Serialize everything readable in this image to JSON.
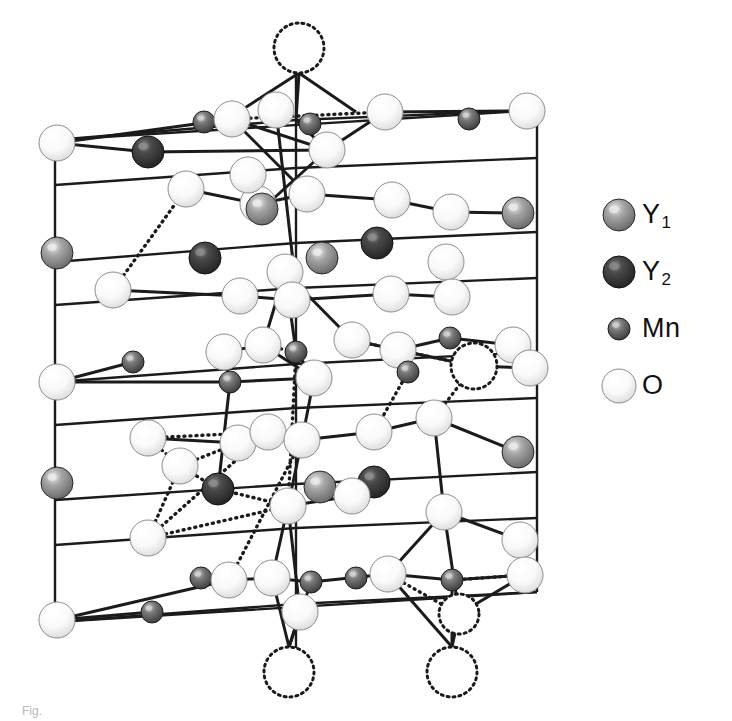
{
  "figure": {
    "kind": "crystal-structure-diagram",
    "compound": "YMnO3",
    "background_color": "#ffffff",
    "caption_fragment": "Fig."
  },
  "legend": {
    "position": "right",
    "items": [
      {
        "id": "Y1",
        "label": "Y",
        "subscript": "1",
        "icon": "sphere-icon",
        "radius": 16,
        "fill": "#7b7b7b",
        "highlight": "#e8e8e8",
        "edge": "#2a2a2a"
      },
      {
        "id": "Y2",
        "label": "Y",
        "subscript": "2",
        "icon": "sphere-icon",
        "radius": 16,
        "fill": "#333333",
        "highlight": "#8a8a8a",
        "edge": "#111111"
      },
      {
        "id": "Mn",
        "label": "Mn",
        "subscript": "",
        "icon": "sphere-icon",
        "radius": 11,
        "fill": "#565656",
        "highlight": "#d2d2d2",
        "edge": "#1d1d1d"
      },
      {
        "id": "O",
        "label": "O",
        "subscript": "",
        "icon": "sphere-icon",
        "radius": 17,
        "fill": "#f4f4f4",
        "highlight": "#ffffff",
        "edge": "#8d8d8d"
      }
    ]
  },
  "structure": {
    "viewbox": "0 0 600 700",
    "bond_color": "#1b1b1b",
    "bond_width": 3.0,
    "cell_edge_width": 2.4,
    "dotted_bond_width": 3.4,
    "dotted_dash": "1 5",
    "ghost_circle": {
      "stroke": "#1b1b1b",
      "dash": "2 4",
      "width": 3,
      "fill": "#ffffff"
    },
    "species": {
      "Y1": {
        "r": 16,
        "fill": "#7b7b7b",
        "highlight": "#ececec",
        "edge": "#2a2a2a"
      },
      "Y2": {
        "r": 16,
        "fill": "#333333",
        "highlight": "#8f8f8f",
        "edge": "#111111"
      },
      "Mn": {
        "r": 11,
        "fill": "#565656",
        "highlight": "#d6d6d6",
        "edge": "#1d1d1d"
      },
      "O": {
        "r": 18,
        "fill": "#f5f5f5",
        "highlight": "#ffffff",
        "edge": "#8d8d8d"
      }
    },
    "cell_edges": [
      [
        55,
        140,
        55,
        622
      ],
      [
        537,
        110,
        537,
        592
      ],
      [
        296,
        48,
        296,
        686
      ],
      [
        55,
        140,
        537,
        110
      ],
      [
        55,
        622,
        537,
        592
      ]
    ],
    "frame_rails": [
      [
        55,
        140,
        296,
        120
      ],
      [
        296,
        120,
        537,
        110
      ],
      [
        55,
        185,
        296,
        168
      ],
      [
        296,
        168,
        537,
        158
      ],
      [
        55,
        262,
        296,
        243
      ],
      [
        296,
        243,
        537,
        232
      ],
      [
        55,
        305,
        296,
        288
      ],
      [
        296,
        288,
        537,
        278
      ],
      [
        55,
        382,
        296,
        364
      ],
      [
        296,
        364,
        537,
        352
      ],
      [
        55,
        425,
        296,
        408
      ],
      [
        296,
        408,
        537,
        398
      ],
      [
        55,
        500,
        296,
        484
      ],
      [
        296,
        484,
        537,
        472
      ],
      [
        55,
        545,
        296,
        528
      ],
      [
        296,
        528,
        537,
        518
      ],
      [
        55,
        622,
        296,
        604
      ],
      [
        296,
        604,
        537,
        592
      ]
    ],
    "ghost_atoms": [
      {
        "cx": 299,
        "cy": 48,
        "r": 25,
        "species": "O"
      },
      {
        "cx": 474,
        "cy": 366,
        "r": 23,
        "species": "O"
      },
      {
        "cx": 289,
        "cy": 672,
        "r": 25,
        "species": "O"
      },
      {
        "cx": 452,
        "cy": 672,
        "r": 25,
        "species": "O"
      },
      {
        "cx": 459,
        "cy": 614,
        "r": 20,
        "species": "O"
      }
    ],
    "atoms": [
      {
        "cx": 57,
        "cy": 143,
        "species": "O"
      },
      {
        "cx": 148,
        "cy": 152,
        "species": "Y2"
      },
      {
        "cx": 204,
        "cy": 122,
        "species": "Mn"
      },
      {
        "cx": 232,
        "cy": 119,
        "species": "O"
      },
      {
        "cx": 276,
        "cy": 110,
        "species": "O"
      },
      {
        "cx": 310,
        "cy": 124,
        "species": "Mn"
      },
      {
        "cx": 327,
        "cy": 150,
        "species": "O"
      },
      {
        "cx": 385,
        "cy": 112,
        "species": "O"
      },
      {
        "cx": 469,
        "cy": 119,
        "species": "Mn"
      },
      {
        "cx": 527,
        "cy": 111,
        "species": "O"
      },
      {
        "cx": 186,
        "cy": 189,
        "species": "O"
      },
      {
        "cx": 258,
        "cy": 204,
        "species": "O"
      },
      {
        "cx": 248,
        "cy": 175,
        "species": "O"
      },
      {
        "cx": 307,
        "cy": 194,
        "species": "O"
      },
      {
        "cx": 392,
        "cy": 200,
        "species": "O"
      },
      {
        "cx": 451,
        "cy": 212,
        "species": "O"
      },
      {
        "cx": 518,
        "cy": 213,
        "species": "Y1"
      },
      {
        "cx": 262,
        "cy": 209,
        "species": "Y1"
      },
      {
        "cx": 57,
        "cy": 253,
        "species": "Y1"
      },
      {
        "cx": 205,
        "cy": 258,
        "species": "Y2"
      },
      {
        "cx": 322,
        "cy": 258,
        "species": "Y1"
      },
      {
        "cx": 377,
        "cy": 243,
        "species": "Y2"
      },
      {
        "cx": 446,
        "cy": 262,
        "species": "O"
      },
      {
        "cx": 285,
        "cy": 272,
        "species": "O"
      },
      {
        "cx": 113,
        "cy": 290,
        "species": "O"
      },
      {
        "cx": 240,
        "cy": 296,
        "species": "O"
      },
      {
        "cx": 292,
        "cy": 300,
        "species": "O"
      },
      {
        "cx": 391,
        "cy": 294,
        "species": "O"
      },
      {
        "cx": 452,
        "cy": 297,
        "species": "O"
      },
      {
        "cx": 263,
        "cy": 345,
        "species": "O"
      },
      {
        "cx": 224,
        "cy": 352,
        "species": "O"
      },
      {
        "cx": 296,
        "cy": 352,
        "species": "Mn"
      },
      {
        "cx": 352,
        "cy": 340,
        "species": "O"
      },
      {
        "cx": 398,
        "cy": 350,
        "species": "O"
      },
      {
        "cx": 450,
        "cy": 338,
        "species": "Mn"
      },
      {
        "cx": 513,
        "cy": 345,
        "species": "O"
      },
      {
        "cx": 57,
        "cy": 382,
        "species": "O"
      },
      {
        "cx": 133,
        "cy": 362,
        "species": "Mn"
      },
      {
        "cx": 230,
        "cy": 382,
        "species": "Mn"
      },
      {
        "cx": 314,
        "cy": 378,
        "species": "O"
      },
      {
        "cx": 408,
        "cy": 372,
        "species": "Mn"
      },
      {
        "cx": 530,
        "cy": 368,
        "species": "O"
      },
      {
        "cx": 148,
        "cy": 438,
        "species": "O"
      },
      {
        "cx": 238,
        "cy": 443,
        "species": "O"
      },
      {
        "cx": 268,
        "cy": 432,
        "species": "O"
      },
      {
        "cx": 302,
        "cy": 440,
        "species": "O"
      },
      {
        "cx": 374,
        "cy": 432,
        "species": "O"
      },
      {
        "cx": 434,
        "cy": 418,
        "species": "O"
      },
      {
        "cx": 518,
        "cy": 452,
        "species": "Y1"
      },
      {
        "cx": 57,
        "cy": 483,
        "species": "Y1"
      },
      {
        "cx": 218,
        "cy": 489,
        "species": "Y2"
      },
      {
        "cx": 180,
        "cy": 466,
        "species": "O"
      },
      {
        "cx": 320,
        "cy": 487,
        "species": "Y1"
      },
      {
        "cx": 374,
        "cy": 482,
        "species": "Y2"
      },
      {
        "cx": 352,
        "cy": 496,
        "species": "O"
      },
      {
        "cx": 288,
        "cy": 506,
        "species": "O"
      },
      {
        "cx": 148,
        "cy": 538,
        "species": "O"
      },
      {
        "cx": 444,
        "cy": 512,
        "species": "O"
      },
      {
        "cx": 520,
        "cy": 540,
        "species": "O"
      },
      {
        "cx": 201,
        "cy": 578,
        "species": "Mn"
      },
      {
        "cx": 229,
        "cy": 580,
        "species": "O"
      },
      {
        "cx": 272,
        "cy": 578,
        "species": "O"
      },
      {
        "cx": 311,
        "cy": 582,
        "species": "Mn"
      },
      {
        "cx": 356,
        "cy": 578,
        "species": "Mn"
      },
      {
        "cx": 388,
        "cy": 574,
        "species": "O"
      },
      {
        "cx": 452,
        "cy": 580,
        "species": "Mn"
      },
      {
        "cx": 525,
        "cy": 575,
        "species": "O"
      },
      {
        "cx": 57,
        "cy": 620,
        "species": "O"
      },
      {
        "cx": 152,
        "cy": 612,
        "species": "Mn"
      },
      {
        "cx": 300,
        "cy": 612,
        "species": "O"
      }
    ],
    "solid_bonds": [
      [
        299,
        73,
        237,
        113
      ],
      [
        299,
        73,
        296,
        120
      ],
      [
        299,
        73,
        356,
        112
      ],
      [
        57,
        143,
        232,
        119
      ],
      [
        57,
        143,
        148,
        152
      ],
      [
        232,
        119,
        327,
        150
      ],
      [
        327,
        150,
        385,
        112
      ],
      [
        385,
        112,
        527,
        111
      ],
      [
        148,
        152,
        327,
        150
      ],
      [
        296,
        120,
        327,
        150
      ],
      [
        232,
        119,
        307,
        194
      ],
      [
        327,
        150,
        262,
        209
      ],
      [
        276,
        110,
        296,
        288
      ],
      [
        186,
        189,
        258,
        204
      ],
      [
        258,
        204,
        307,
        194
      ],
      [
        307,
        194,
        392,
        200
      ],
      [
        392,
        200,
        451,
        212
      ],
      [
        451,
        212,
        518,
        213
      ],
      [
        113,
        290,
        240,
        296
      ],
      [
        240,
        296,
        292,
        300
      ],
      [
        292,
        300,
        391,
        294
      ],
      [
        391,
        294,
        452,
        297
      ],
      [
        285,
        272,
        263,
        345
      ],
      [
        285,
        272,
        296,
        352
      ],
      [
        285,
        272,
        352,
        340
      ],
      [
        263,
        345,
        224,
        352
      ],
      [
        263,
        345,
        314,
        378
      ],
      [
        352,
        340,
        398,
        350
      ],
      [
        398,
        350,
        450,
        338
      ],
      [
        398,
        350,
        474,
        366
      ],
      [
        314,
        378,
        230,
        382
      ],
      [
        314,
        378,
        302,
        440
      ],
      [
        57,
        382,
        133,
        362
      ],
      [
        57,
        382,
        230,
        382
      ],
      [
        450,
        338,
        513,
        345
      ],
      [
        474,
        366,
        530,
        368
      ],
      [
        148,
        438,
        238,
        443
      ],
      [
        238,
        443,
        268,
        432
      ],
      [
        268,
        432,
        302,
        440
      ],
      [
        302,
        440,
        374,
        432
      ],
      [
        374,
        432,
        434,
        418
      ],
      [
        434,
        418,
        518,
        452
      ],
      [
        288,
        506,
        352,
        496
      ],
      [
        352,
        496,
        374,
        482
      ],
      [
        229,
        580,
        272,
        578
      ],
      [
        272,
        578,
        311,
        582
      ],
      [
        311,
        582,
        388,
        574
      ],
      [
        388,
        574,
        452,
        580
      ],
      [
        452,
        580,
        525,
        575
      ],
      [
        57,
        620,
        229,
        580
      ],
      [
        57,
        620,
        152,
        612
      ],
      [
        300,
        612,
        289,
        647
      ],
      [
        272,
        578,
        289,
        647
      ],
      [
        311,
        582,
        289,
        647
      ],
      [
        388,
        574,
        452,
        647
      ],
      [
        452,
        580,
        452,
        647
      ],
      [
        459,
        614,
        452,
        647
      ],
      [
        434,
        418,
        444,
        512
      ],
      [
        444,
        512,
        520,
        540
      ],
      [
        444,
        512,
        388,
        574
      ],
      [
        520,
        540,
        525,
        575
      ],
      [
        444,
        512,
        459,
        614
      ],
      [
        525,
        575,
        459,
        614
      ],
      [
        302,
        440,
        288,
        506
      ],
      [
        288,
        506,
        272,
        578
      ],
      [
        288,
        506,
        300,
        612
      ],
      [
        224,
        352,
        230,
        382
      ],
      [
        230,
        382,
        218,
        489
      ],
      [
        296,
        352,
        314,
        378
      ]
    ],
    "dotted_bonds": [
      [
        232,
        119,
        385,
        112
      ],
      [
        263,
        345,
        296,
        352
      ],
      [
        296,
        352,
        314,
        378
      ],
      [
        352,
        340,
        398,
        350
      ],
      [
        398,
        350,
        474,
        366
      ],
      [
        296,
        352,
        288,
        506
      ],
      [
        398,
        350,
        408,
        372
      ],
      [
        408,
        372,
        374,
        432
      ],
      [
        148,
        438,
        268,
        432
      ],
      [
        148,
        438,
        180,
        466
      ],
      [
        180,
        466,
        238,
        443
      ],
      [
        148,
        538,
        268,
        432
      ],
      [
        148,
        538,
        180,
        466
      ],
      [
        218,
        489,
        288,
        506
      ],
      [
        218,
        489,
        180,
        466
      ],
      [
        148,
        538,
        288,
        506
      ],
      [
        434,
        418,
        474,
        366
      ],
      [
        229,
        580,
        302,
        440
      ],
      [
        388,
        574,
        459,
        614
      ],
      [
        452,
        580,
        525,
        575
      ],
      [
        113,
        290,
        186,
        189
      ]
    ]
  }
}
